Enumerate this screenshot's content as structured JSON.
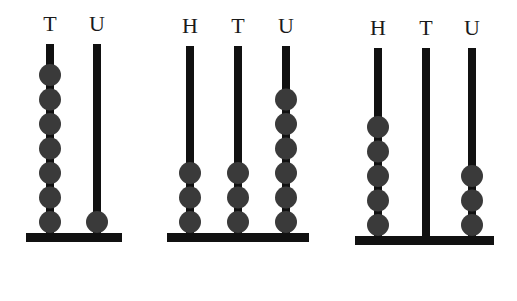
{
  "colors": {
    "rod": "#111111",
    "base": "#111111",
    "bead": "#3a3a3a",
    "label": "#1a1a1a",
    "background": "#ffffff"
  },
  "abaci": [
    {
      "id": "abacus-1",
      "base": {
        "x": 26,
        "y": 233,
        "width": 96,
        "height": 9
      },
      "rod_top": 44,
      "columns": [
        {
          "label": "T",
          "x": 50,
          "beads": 7
        },
        {
          "label": "U",
          "x": 97,
          "beads": 1
        }
      ]
    },
    {
      "id": "abacus-2",
      "base": {
        "x": 167,
        "y": 233,
        "width": 142,
        "height": 9
      },
      "rod_top": 46,
      "columns": [
        {
          "label": "H",
          "x": 190,
          "beads": 3
        },
        {
          "label": "T",
          "x": 238,
          "beads": 3
        },
        {
          "label": "U",
          "x": 286,
          "beads": 6
        }
      ]
    },
    {
      "id": "abacus-3",
      "base": {
        "x": 355,
        "y": 236,
        "width": 139,
        "height": 9
      },
      "rod_top": 48,
      "columns": [
        {
          "label": "H",
          "x": 378,
          "beads": 5
        },
        {
          "label": "T",
          "x": 426,
          "beads": 0
        },
        {
          "label": "U",
          "x": 472,
          "beads": 3
        }
      ]
    }
  ],
  "bead": {
    "radius": 11,
    "spacing": 24.5
  }
}
